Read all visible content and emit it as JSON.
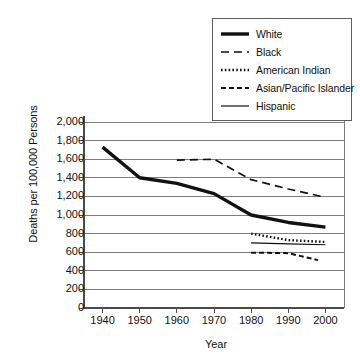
{
  "chart_data": {
    "type": "line",
    "title": "",
    "xlabel": "Year",
    "ylabel": "Deaths per 100,000 Persons",
    "xlim": [
      1935,
      2005
    ],
    "ylim": [
      0,
      2000
    ],
    "grid": true,
    "legend_position": "top-right",
    "xticks": [
      1940,
      1950,
      1960,
      1970,
      1980,
      1990,
      2000
    ],
    "xtick_labels": [
      "1940",
      "1950",
      "1960",
      "1970",
      "1980",
      "1990",
      "2000"
    ],
    "yticks": [
      0,
      200,
      400,
      600,
      800,
      1000,
      1200,
      1400,
      1600,
      1800,
      2000
    ],
    "ytick_labels": [
      "0",
      "200",
      "400",
      "600",
      "800",
      "1,000",
      "1,200",
      "1,400",
      "1,600",
      "1,800",
      "2,000"
    ],
    "series": [
      {
        "name": "White",
        "style": "solid-thick",
        "color": "#111111",
        "x": [
          1940,
          1950,
          1960,
          1970,
          1980,
          1990,
          2000
        ],
        "values": [
          1730,
          1400,
          1340,
          1230,
          1000,
          920,
          870
        ]
      },
      {
        "name": "Black",
        "style": "dashed-long",
        "color": "#111111",
        "x": [
          1960,
          1970,
          1980,
          1990,
          2000
        ],
        "values": [
          1590,
          1600,
          1380,
          1280,
          1190
        ]
      },
      {
        "name": "American Indian",
        "style": "dotted",
        "color": "#111111",
        "x": [
          1980,
          1990,
          2000
        ],
        "values": [
          800,
          730,
          710
        ]
      },
      {
        "name": "Asian/Pacific Islander",
        "style": "dashed-short",
        "color": "#111111",
        "x": [
          1980,
          1990,
          1998
        ],
        "values": [
          595,
          590,
          515
        ]
      },
      {
        "name": "Hispanic",
        "style": "solid-thin",
        "color": "#111111",
        "x": [
          1980,
          1990,
          2000
        ],
        "values": [
          700,
          690,
          680
        ]
      }
    ]
  },
  "legend": {
    "items": [
      {
        "label": "White"
      },
      {
        "label": "Black"
      },
      {
        "label": "American Indian"
      },
      {
        "label": "Asian/Pacific Islander"
      },
      {
        "label": "Hispanic"
      }
    ]
  }
}
